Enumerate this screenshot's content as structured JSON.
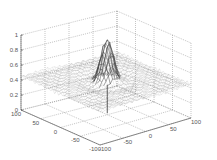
{
  "chart_data": {
    "type": "surface",
    "title": "",
    "xlabel": "",
    "ylabel": "",
    "zlabel": "",
    "function_hint": "sinc-like radial mesh, peak at origin",
    "x_ticks": [
      "-100",
      "-50",
      "0",
      "50",
      "100"
    ],
    "y_ticks": [
      "100",
      "50",
      "0",
      "-50",
      "-100"
    ],
    "z_ticks": [
      "0",
      "0.2",
      "0.4",
      "0.6",
      "0.8",
      "1"
    ],
    "xlim": [
      -100,
      100
    ],
    "ylim": [
      -100,
      100
    ],
    "zlim": [
      0,
      1
    ],
    "peak": {
      "x": 0,
      "y": 0,
      "z": 1.0
    },
    "baseline_z": 0.45,
    "grid": true,
    "grid_style": "dotted",
    "mesh_color": "#9a9a9a",
    "peak_color": "#333333",
    "axis_color": "#444444"
  }
}
